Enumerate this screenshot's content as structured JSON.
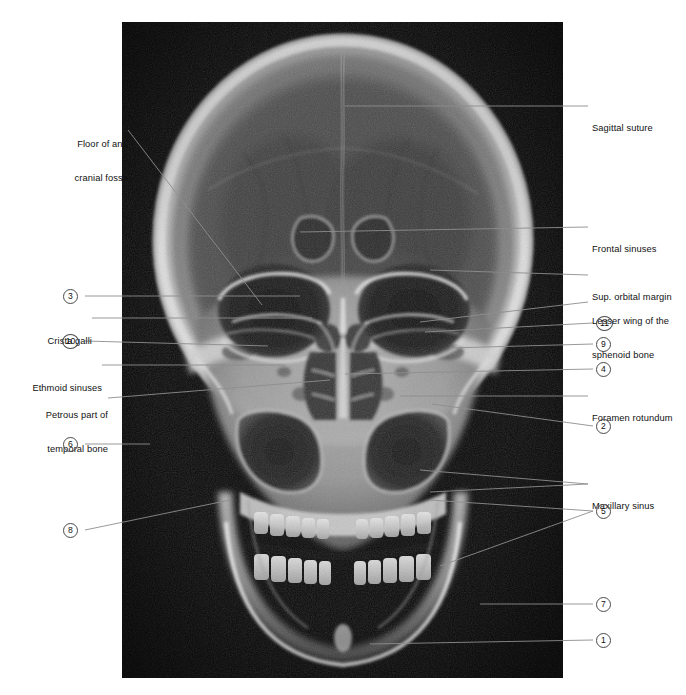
{
  "figure": {
    "modality": "plain radiograph",
    "projection": "anteroposterior",
    "plate": {
      "x": 122,
      "y": 22,
      "width": 441,
      "height": 656,
      "background_color": "#0a0a0a"
    },
    "style": {
      "leader_color": "#8d8d8d",
      "leader_color_on_film": "#b9b9b9",
      "text_color": "#111111",
      "callout_border_color": "#4a4a4a",
      "page_background": "#ffffff"
    }
  },
  "text_labels": [
    {
      "id": "floor-of-ant-cranial-fossa",
      "text": "Floor of ant.\ncranial fossa",
      "side": "left",
      "x": 38,
      "y": 116,
      "lines": [
        "Floor of ant.",
        "cranial fossa"
      ],
      "leader": [
        [
          128,
          130
        ],
        [
          262,
          305
        ]
      ]
    },
    {
      "id": "crista-galli",
      "text": "Crista galli",
      "side": "left",
      "x": 33,
      "y": 313,
      "lines": [
        "Crista galli"
      ],
      "leader": [
        [
          92,
          318
        ],
        [
          312,
          318
        ]
      ]
    },
    {
      "id": "ethmoid-sinuses",
      "text": "Ethmoid sinuses",
      "side": "left",
      "x": 13,
      "y": 360,
      "lines": [
        "Ethmoid sinuses"
      ],
      "leader": [
        [
          102,
          365
        ],
        [
          285,
          365
        ]
      ]
    },
    {
      "id": "petrous-part-of-temporal-bone",
      "text": "Petrous part of\ntemporal bone",
      "side": "left",
      "x": 22,
      "y": 387,
      "lines": [
        "Petrous part of",
        "temporal bone"
      ],
      "leader": [
        [
          108,
          398
        ],
        [
          330,
          380
        ]
      ]
    },
    {
      "id": "sagittal-suture",
      "text": "Sagittal suture",
      "side": "right",
      "x": 592,
      "y": 102,
      "lines": [
        "Sagittal suture"
      ],
      "leader": [
        [
          588,
          106
        ],
        [
          345,
          106
        ]
      ]
    },
    {
      "id": "frontal-sinuses",
      "text": "Frontal sinuses",
      "side": "right",
      "x": 592,
      "y": 222,
      "lines": [
        "Frontal sinuses"
      ],
      "leader": [
        [
          588,
          227
        ],
        [
          300,
          232
        ]
      ]
    },
    {
      "id": "sup-orbital-margin",
      "text": "Sup. orbital margin",
      "side": "right",
      "x": 592,
      "y": 270,
      "lines": [
        "Sup. orbital margin"
      ],
      "leader": [
        [
          588,
          275
        ],
        [
          430,
          270
        ]
      ]
    },
    {
      "id": "lesser-wing-of-the-sphenoid-bone",
      "text": "Lesser wing of the\nsphenoid bone",
      "side": "right",
      "x": 592,
      "y": 294,
      "lines": [
        "Lesser wing of the",
        "sphenoid bone"
      ],
      "leader": [
        [
          588,
          302
        ],
        [
          420,
          322
        ]
      ]
    },
    {
      "id": "foramen-rotundum",
      "text": "Foramen rotundum",
      "side": "right",
      "x": 592,
      "y": 391,
      "lines": [
        "Foramen rotundum"
      ],
      "leader": [
        [
          588,
          396
        ],
        [
          400,
          396
        ]
      ]
    },
    {
      "id": "maxillary-sinus",
      "text": "Maxillary sinus",
      "side": "right",
      "x": 592,
      "y": 479,
      "lines": [
        "Maxillary sinus"
      ],
      "leader_multi": [
        [
          [
            588,
            484
          ],
          [
            420,
            470
          ]
        ],
        [
          [
            588,
            484
          ],
          [
            430,
            492
          ]
        ]
      ]
    }
  ],
  "numbered_callouts": [
    {
      "number": "3",
      "side": "left",
      "x": 63,
      "y": 289,
      "leader": [
        [
          85,
          296
        ],
        [
          300,
          296
        ]
      ]
    },
    {
      "number": "10",
      "side": "left",
      "x": 63,
      "y": 334,
      "leader": [
        [
          85,
          341
        ],
        [
          268,
          346
        ]
      ]
    },
    {
      "number": "6",
      "side": "left",
      "x": 63,
      "y": 437,
      "leader": [
        [
          85,
          444
        ],
        [
          150,
          444
        ]
      ]
    },
    {
      "number": "8",
      "side": "left",
      "x": 63,
      "y": 523,
      "leader": [
        [
          85,
          530
        ],
        [
          230,
          500
        ]
      ]
    },
    {
      "number": "11",
      "side": "right",
      "x": 596,
      "y": 316,
      "leader": [
        [
          593,
          323
        ],
        [
          425,
          332
        ]
      ],
      "wide": true
    },
    {
      "number": "9",
      "side": "right",
      "x": 596,
      "y": 337,
      "leader": [
        [
          593,
          344
        ],
        [
          450,
          348
        ]
      ]
    },
    {
      "number": "4",
      "side": "right",
      "x": 596,
      "y": 362,
      "leader": [
        [
          593,
          369
        ],
        [
          345,
          374
        ]
      ]
    },
    {
      "number": "2",
      "side": "right",
      "x": 596,
      "y": 419,
      "leader": [
        [
          593,
          426
        ],
        [
          432,
          404
        ]
      ]
    },
    {
      "number": "5",
      "side": "right",
      "x": 596,
      "y": 504,
      "leader_multi": [
        [
          [
            593,
            511
          ],
          [
            430,
            500
          ]
        ],
        [
          [
            593,
            511
          ],
          [
            440,
            566
          ]
        ]
      ]
    },
    {
      "number": "7",
      "side": "right",
      "x": 596,
      "y": 597,
      "leader": [
        [
          593,
          604
        ],
        [
          480,
          604
        ]
      ]
    },
    {
      "number": "1",
      "side": "right",
      "x": 596,
      "y": 633,
      "leader": [
        [
          593,
          640
        ],
        [
          370,
          644
        ]
      ]
    }
  ],
  "anatomy_described": {
    "named": [
      "Floor of ant. cranial fossa",
      "Crista galli",
      "Ethmoid sinuses",
      "Petrous part of temporal bone",
      "Sagittal suture",
      "Frontal sinuses",
      "Sup. orbital margin",
      "Lesser wing of the sphenoid bone",
      "Foramen rotundum",
      "Maxillary sinus"
    ],
    "numbered": [
      "1",
      "2",
      "3",
      "4",
      "5",
      "6",
      "7",
      "8",
      "9",
      "10",
      "11"
    ]
  }
}
